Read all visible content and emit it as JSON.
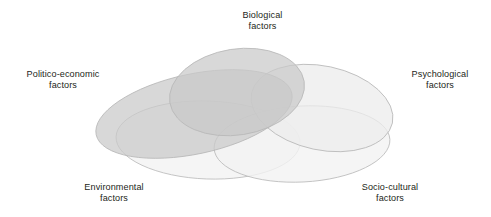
{
  "figure": {
    "type": "venn-diagram",
    "ellipse_count": 5,
    "background_color": "#ffffff",
    "stroke_color": "#b7b7b7",
    "text_color": "#231f20"
  },
  "labels": {
    "biological": {
      "line1": "Biological",
      "line2": "factors"
    },
    "politico": {
      "line1": "Politico-economic",
      "line2": "factors"
    },
    "psychological": {
      "line1": "Psychological",
      "line2": "factors"
    },
    "environmental": {
      "line1": "Environmental",
      "line2": "factors"
    },
    "sociocultural": {
      "line1": "Socio-cultural",
      "line2": "factors"
    }
  },
  "chart_data": {
    "type": "venn",
    "title": "",
    "sets": [
      {
        "name": "Biological factors",
        "label_lines": [
          "Biological",
          "factors"
        ],
        "fill": "#c9c9c9",
        "opacity": 0.72,
        "cx": 237,
        "cy": 92,
        "rx": 68,
        "ry": 43,
        "rotate": -9,
        "label_position": "top"
      },
      {
        "name": "Politico-economic factors",
        "label_lines": [
          "Politico-economic",
          "factors"
        ],
        "fill": "#c9c9c9",
        "opacity": 0.72,
        "cx": 194,
        "cy": 114,
        "rx": 100,
        "ry": 40,
        "rotate": -12,
        "label_position": "left"
      },
      {
        "name": "Psychological factors",
        "label_lines": [
          "Psychological",
          "factors"
        ],
        "fill": "#ececec",
        "opacity": 0.75,
        "cx": 322,
        "cy": 108,
        "rx": 72,
        "ry": 42,
        "rotate": 12,
        "label_position": "right"
      },
      {
        "name": "Environmental factors",
        "label_lines": [
          "Environmental",
          "factors"
        ],
        "fill": "#f2f2f2",
        "opacity": 0.8,
        "cx": 208,
        "cy": 140,
        "rx": 92,
        "ry": 39,
        "rotate": 2,
        "label_position": "bottom-left"
      },
      {
        "name": "Socio-cultural factors",
        "label_lines": [
          "Socio-cultural",
          "factors"
        ],
        "fill": "#f2f2f2",
        "opacity": 0.8,
        "cx": 302,
        "cy": 144,
        "rx": 88,
        "ry": 38,
        "rotate": -3,
        "label_position": "bottom-right"
      }
    ],
    "note": "Five overlapping translucent ellipses; darker gray fills are the Biological and Politico-economic sets, the remaining three are near-white. All five sets mutually overlap near the centre."
  }
}
